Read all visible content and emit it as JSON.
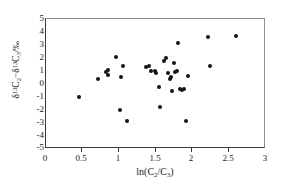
{
  "chart_data": {
    "type": "scatter",
    "title": "",
    "xlabel": "ln(C2/C3)",
    "ylabel": "d13C2 - d13C3 / permil",
    "xlim": [
      0,
      3
    ],
    "ylim": [
      -5,
      5
    ],
    "xticks": [
      0,
      0.5,
      1,
      1.5,
      2,
      2.5,
      3
    ],
    "xticklabels": [
      "0",
      "0.5",
      "1",
      "1.5",
      "2",
      "2.5",
      "3"
    ],
    "yticks": [
      -5,
      -4,
      -3,
      -2,
      -1,
      0,
      1,
      2,
      3,
      4,
      5
    ],
    "yticklabels": [
      "-5",
      "-4",
      "-3",
      "-2",
      "-1",
      "0",
      "1",
      "2",
      "3",
      "4",
      "5"
    ],
    "grid": false,
    "legend": null,
    "marker": "filled-diamond",
    "marker_color": "#14141e",
    "series": [
      {
        "name": "samples",
        "points": [
          [
            0.45,
            -1.1
          ],
          [
            0.72,
            0.3
          ],
          [
            0.83,
            0.85
          ],
          [
            0.85,
            1.05
          ],
          [
            0.86,
            0.65
          ],
          [
            0.97,
            2.0
          ],
          [
            1.02,
            -2.1
          ],
          [
            1.03,
            0.45
          ],
          [
            1.06,
            1.35
          ],
          [
            1.12,
            -3.0
          ],
          [
            1.37,
            1.25
          ],
          [
            1.42,
            1.3
          ],
          [
            1.45,
            0.9
          ],
          [
            1.5,
            0.95
          ],
          [
            1.51,
            0.8
          ],
          [
            1.55,
            -0.3
          ],
          [
            1.57,
            -1.9
          ],
          [
            1.62,
            1.7
          ],
          [
            1.65,
            1.95
          ],
          [
            1.68,
            0.75
          ],
          [
            1.7,
            0.3
          ],
          [
            1.72,
            0.5
          ],
          [
            1.74,
            -0.6
          ],
          [
            1.76,
            1.6
          ],
          [
            1.78,
            0.85
          ],
          [
            1.8,
            0.9
          ],
          [
            1.82,
            3.15
          ],
          [
            1.85,
            -0.45
          ],
          [
            1.87,
            -0.55
          ],
          [
            1.9,
            -0.5
          ],
          [
            1.92,
            -3.0
          ],
          [
            1.96,
            0.55
          ],
          [
            2.23,
            3.6
          ],
          [
            2.25,
            1.35
          ],
          [
            2.62,
            3.65
          ]
        ]
      }
    ]
  },
  "axes": {
    "y_title_parts": {
      "d1": "δ",
      "sup1": "13",
      "c1": "C",
      "sub1": "2",
      "dash": "−",
      "d2": "δ",
      "sup2": "13",
      "c2": "C",
      "sub2": "3",
      "unit": "/‰"
    },
    "x_title_parts": {
      "ln": "ln(C",
      "sub1": "2",
      "slash": "/C",
      "sub2": "3",
      "close": ")"
    }
  }
}
